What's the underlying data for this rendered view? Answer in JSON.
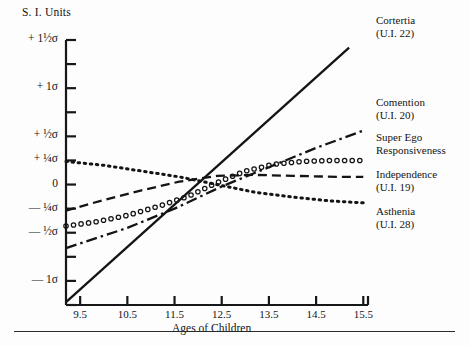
{
  "figure": {
    "axis_caption": "S. I. Units",
    "x_axis_title": "Ages of Children"
  },
  "chart_data": {
    "type": "line",
    "title": "",
    "xlabel": "Ages of Children",
    "ylabel": "S. I. Units",
    "xlim": [
      9.2,
      15.6
    ],
    "ylim": [
      -1.25,
      1.5
    ],
    "grid": false,
    "legend_position": "right",
    "x_ticks": [
      "9.5",
      "10.5",
      "11.5",
      "12.5",
      "13.5",
      "14.5",
      "15.5"
    ],
    "x_tick_values": [
      9.5,
      10.5,
      11.5,
      12.5,
      13.5,
      14.5,
      15.5
    ],
    "y_ticks": [
      "+ 1½σ",
      "+ 1σ",
      "+ ½σ",
      "+ ¼σ",
      "0",
      "— ¼σ",
      "— ½σ",
      "— 1σ"
    ],
    "y_tick_values": [
      1.5,
      1.0,
      0.5,
      0.25,
      0.0,
      -0.25,
      -0.5,
      -1.0
    ],
    "y_minor_tick_values": [
      1.25,
      0.75,
      -0.75,
      -1.25
    ],
    "series": [
      {
        "name": "Cortertia",
        "code": "(U.I. 22)",
        "style": "solid",
        "x": [
          9.2,
          15.2
        ],
        "values": [
          -1.22,
          1.42
        ]
      },
      {
        "name": "Comention",
        "code": "(U.I. 20)",
        "style": "dash-dot",
        "x": [
          9.2,
          10.5,
          11.5,
          12.5,
          13.5,
          14.5,
          15.5
        ],
        "values": [
          -0.66,
          -0.45,
          -0.25,
          -0.02,
          0.18,
          0.38,
          0.56
        ]
      },
      {
        "name": "Super Ego Responsiveness",
        "code": "",
        "style": "open-circles",
        "x": [
          9.2,
          9.8,
          10.5,
          11.2,
          11.8,
          12.4,
          13.0,
          13.6,
          14.2,
          14.8,
          15.5
        ],
        "values": [
          -0.43,
          -0.39,
          -0.32,
          -0.22,
          -0.12,
          0.02,
          0.14,
          0.21,
          0.24,
          0.25,
          0.25
        ]
      },
      {
        "name": "Independence",
        "code": "(U.I. 19)",
        "style": "dashed",
        "x": [
          9.2,
          10.0,
          10.8,
          11.6,
          12.4,
          13.2,
          14.0,
          15.0,
          15.5
        ],
        "values": [
          -0.27,
          -0.16,
          -0.06,
          0.03,
          0.09,
          0.1,
          0.09,
          0.08,
          0.08
        ]
      },
      {
        "name": "Asthenia",
        "code": "(U.I. 28)",
        "style": "dotted",
        "x": [
          9.2,
          10.0,
          10.8,
          11.6,
          12.4,
          13.2,
          14.0,
          14.8,
          15.5
        ],
        "values": [
          0.24,
          0.2,
          0.14,
          0.08,
          0.0,
          -0.08,
          -0.13,
          -0.17,
          -0.19
        ]
      }
    ]
  },
  "legend": [
    {
      "name": "Cortertia",
      "line1": "Cortertia",
      "line2": "(U.I. 22)"
    },
    {
      "name": "Comention",
      "line1": "Comention",
      "line2": "(U.I. 20)"
    },
    {
      "name": "SuperEgo",
      "line1": "Super Ego",
      "line2": "Responsiveness"
    },
    {
      "name": "Independence",
      "line1": "Independence",
      "line2": "(U.I. 19)"
    },
    {
      "name": "Asthenia",
      "line1": "Asthenia",
      "line2": "(U.I. 28)"
    }
  ]
}
